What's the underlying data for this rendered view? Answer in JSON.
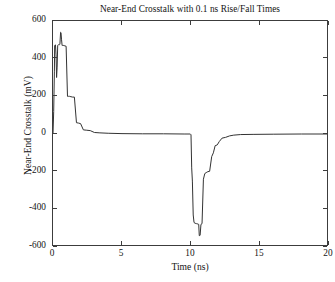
{
  "chart_data": {
    "type": "line",
    "title": "Near-End Crosstalk with 0.1 ns Rise/Fall Times",
    "xlabel": "Time (ns)",
    "ylabel": "Near-End Crosstalk (mV)",
    "xlim": [
      0,
      20
    ],
    "ylim": [
      -600,
      600
    ],
    "xticks": [
      0,
      5,
      10,
      15,
      20
    ],
    "yticks": [
      -600,
      -400,
      -200,
      0,
      200,
      400,
      600
    ],
    "xtick_labels": [
      "0",
      "5",
      "10",
      "15",
      "20"
    ],
    "ytick_labels": [
      "-600",
      "-400",
      "-200",
      "0",
      "200",
      "400",
      "600"
    ],
    "grid": false,
    "legend": null,
    "legend_position": "none",
    "line_color": "#333333",
    "background_color": "#ffffff",
    "axis_color": "#3c3c3c",
    "series": [
      {
        "name": "Near-End Crosstalk",
        "x": [
          0.0,
          0.05,
          0.1,
          0.12,
          0.14,
          0.18,
          0.22,
          0.26,
          0.3,
          0.34,
          0.38,
          0.42,
          0.46,
          0.5,
          0.55,
          0.58,
          0.62,
          0.66,
          0.7,
          0.78,
          0.86,
          0.95,
          1.05,
          1.12,
          1.2,
          1.3,
          1.42,
          1.55,
          1.7,
          1.85,
          2.0,
          2.2,
          2.45,
          2.7,
          3.0,
          3.4,
          4.0,
          5.0,
          6.5,
          8.0,
          9.5,
          9.95,
          10.0,
          10.05,
          10.1,
          10.16,
          10.22,
          10.3,
          10.4,
          10.5,
          10.56,
          10.6,
          10.66,
          10.72,
          10.8,
          10.9,
          11.0,
          11.1,
          11.22,
          11.35,
          11.5,
          11.62,
          11.75,
          11.9,
          12.05,
          12.25,
          12.5,
          12.8,
          13.1,
          13.6,
          14.5,
          16.0,
          18.0,
          20.0
        ],
        "y": [
          0,
          120,
          330,
          470,
          472,
          473,
          420,
          300,
          355,
          470,
          474,
          474,
          474,
          476,
          540,
          538,
          500,
          470,
          470,
          470,
          468,
          466,
          200,
          200,
          200,
          198,
          196,
          196,
          60,
          58,
          55,
          22,
          20,
          18,
          8,
          6,
          4,
          2,
          1,
          1,
          0,
          0,
          -4,
          -180,
          -250,
          -430,
          -470,
          -474,
          -476,
          -478,
          -480,
          -540,
          -538,
          -480,
          -476,
          -240,
          -210,
          -205,
          -200,
          -198,
          -120,
          -100,
          -62,
          -58,
          -40,
          -22,
          -18,
          -10,
          -6,
          -3,
          -2,
          -1,
          0,
          0
        ]
      }
    ]
  },
  "axes": {
    "x_ticks": [
      {
        "label": "0",
        "value": 0
      },
      {
        "label": "5",
        "value": 5
      },
      {
        "label": "10",
        "value": 10
      },
      {
        "label": "15",
        "value": 15
      },
      {
        "label": "20",
        "value": 20
      }
    ],
    "y_ticks": [
      {
        "label": "600",
        "value": 600
      },
      {
        "label": "400",
        "value": 400
      },
      {
        "label": "200",
        "value": 200
      },
      {
        "label": "0",
        "value": 0
      },
      {
        "label": "-200",
        "value": -200
      },
      {
        "label": "-400",
        "value": -400
      },
      {
        "label": "-600",
        "value": -600
      }
    ]
  }
}
